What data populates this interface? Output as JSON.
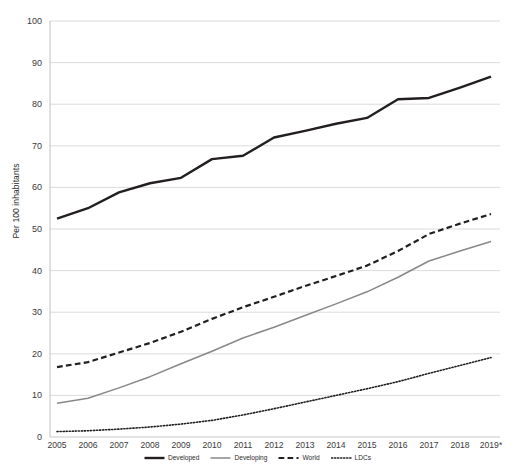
{
  "chart_data": {
    "type": "line",
    "title": "",
    "subtitle": "",
    "xlabel": "",
    "ylabel": "Per 100 inhabitants",
    "ylim": [
      0,
      100
    ],
    "ytick_step": 10,
    "yticks": [
      0,
      10,
      20,
      30,
      40,
      50,
      60,
      70,
      80,
      90,
      100
    ],
    "grid": true,
    "grid_axis": "y",
    "legend_position": "bottom",
    "x": [
      "2005",
      "2006",
      "2007",
      "2008",
      "2009",
      "2010",
      "2011",
      "2012",
      "2013",
      "2014",
      "2015",
      "2016",
      "2017",
      "2018",
      "2019*"
    ],
    "categories": [
      "2005",
      "2006",
      "2007",
      "2008",
      "2009",
      "2010",
      "2011",
      "2012",
      "2013",
      "2014",
      "2015",
      "2016",
      "2017",
      "2018",
      "2019*"
    ],
    "note": "2019 values are estimates, as indicated by the asterisk on the final year label.",
    "series": [
      {
        "name": "Developed",
        "style": "solid",
        "color": "#231f20",
        "width": 2.4,
        "values": [
          52.5,
          55.0,
          58.8,
          61.0,
          62.3,
          66.8,
          67.6,
          72.0,
          73.6,
          75.3,
          76.7,
          81.2,
          81.5,
          84.0,
          86.6
        ]
      },
      {
        "name": "Developing",
        "style": "solid",
        "color": "#888888",
        "width": 1.5,
        "values": [
          8.1,
          9.3,
          11.8,
          14.5,
          17.6,
          20.6,
          23.8,
          26.4,
          29.2,
          32.0,
          34.9,
          38.4,
          42.3,
          44.7,
          47.0
        ]
      },
      {
        "name": "World",
        "style": "dashed",
        "color": "#231f20",
        "width": 2.2,
        "values": [
          16.8,
          18.0,
          20.3,
          22.6,
          25.3,
          28.4,
          31.2,
          33.7,
          36.3,
          38.7,
          41.2,
          44.7,
          48.8,
          51.3,
          53.6
        ]
      },
      {
        "name": "LDCs",
        "style": "dotted",
        "color": "#231f20",
        "width": 1.6,
        "values": [
          1.3,
          1.5,
          1.9,
          2.4,
          3.1,
          4.0,
          5.3,
          6.8,
          8.4,
          10.0,
          11.6,
          13.3,
          15.3,
          17.2,
          19.1
        ]
      }
    ]
  },
  "legend": {
    "items": [
      {
        "label": "Developed",
        "icon": "solid-line-swatch"
      },
      {
        "label": "Developing",
        "icon": "solid-gray-line-swatch"
      },
      {
        "label": "World",
        "icon": "dashed-line-swatch"
      },
      {
        "label": "LDCs",
        "icon": "dotted-line-swatch"
      }
    ]
  }
}
